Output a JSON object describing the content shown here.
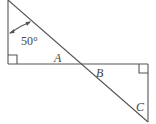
{
  "diagram": {
    "type": "geometry",
    "angle_label": "50°",
    "point_labels": {
      "a": "A",
      "b": "B",
      "c": "C"
    },
    "right_angles": [
      "top-left triangle bottom-left corner",
      "bottom-right triangle top-right corner"
    ],
    "stroke_color": "#555555"
  }
}
